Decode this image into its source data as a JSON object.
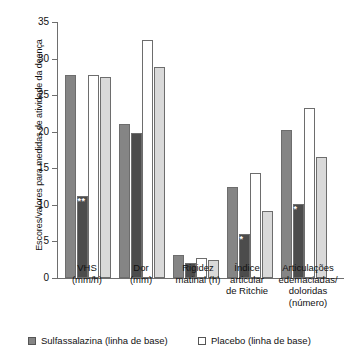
{
  "chart_data": {
    "type": "bar",
    "title": "",
    "xlabel": "",
    "ylabel": "Escores/valores para medidas de atividade da doença",
    "ylim": [
      0,
      35
    ],
    "yticks": [
      0,
      5,
      10,
      15,
      20,
      25,
      30,
      35
    ],
    "ytick_labels": [
      "0",
      "5",
      "10",
      "15",
      "20",
      "25",
      "30",
      "35"
    ],
    "grid": false,
    "legend_position": "bottom",
    "categories": [
      "VHS\n(mm/h)",
      "Dor\n(mm)",
      "Rigidez\nmatinal (h)",
      "Índice\narticular\nde Ritchie",
      "Articulações\nedemaciadas/\ndoloridas\n(número)"
    ],
    "category_lines": [
      [
        "VHS",
        "(mm/h)"
      ],
      [
        "Dor",
        "(mm)"
      ],
      [
        "Rigidez",
        "matinal (h)"
      ],
      [
        "Índice",
        "articular",
        "de Ritchie"
      ],
      [
        "Articulações",
        "edemaciadas/",
        "doloridas",
        "(número)"
      ]
    ],
    "series": [
      {
        "name": "Sulfassalazina (linha de base)",
        "color": "#858585",
        "values": [
          27.7,
          21.0,
          3.2,
          12.4,
          20.3
        ]
      },
      {
        "name": "Sulfassalazina (seguimento)",
        "color": "#4c4c4c",
        "values": [
          11.2,
          19.8,
          2.0,
          6.0,
          10.1
        ]
      },
      {
        "name": "Placebo (linha de base)",
        "color": "#ffffff",
        "values": [
          27.7,
          32.5,
          2.8,
          14.3,
          23.2
        ]
      },
      {
        "name": "Placebo (seguimento)",
        "color": "#d9d9d9",
        "values": [
          27.5,
          28.8,
          2.4,
          9.2,
          16.5
        ]
      }
    ],
    "annotations": [
      {
        "text": "**",
        "category": "VHS (mm/h)",
        "series": "Sulfassalazina (seguimento)",
        "value": 11.2
      },
      {
        "text": "*",
        "category": "Índice articular de Ritchie",
        "series": "Sulfassalazina (seguimento)",
        "value": 6.0
      },
      {
        "text": "*",
        "category": "Articulações edemaciadas/doloridas (número)",
        "series": "Sulfassalazina (seguimento)",
        "value": 10.1
      }
    ]
  },
  "legend": {
    "items": [
      {
        "label": "Sulfassalazina (linha de base)",
        "swatch": "#858585"
      },
      {
        "label": "Placebo (linha de base)",
        "swatch": "#ffffff"
      }
    ]
  }
}
